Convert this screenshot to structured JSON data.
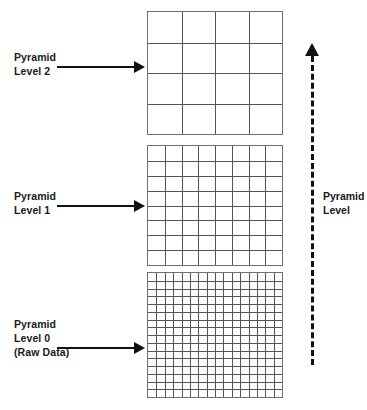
{
  "diagram": {
    "background_color": "#ffffff",
    "line_color": "#555555",
    "text_color": "#1a1a1a"
  },
  "levels": [
    {
      "id": "level-2",
      "label_lines": [
        "Pyramid",
        "Level 2"
      ],
      "grid_columns": 4,
      "grid_rows": 4,
      "arrow": "right-arrow"
    },
    {
      "id": "level-1",
      "label_lines": [
        "Pyramid",
        "Level 1"
      ],
      "grid_columns": 8,
      "grid_rows": 8,
      "arrow": "right-arrow"
    },
    {
      "id": "level-0",
      "label_lines": [
        "Pyramid",
        "Level 0",
        "(Raw Data)"
      ],
      "grid_columns": 16,
      "grid_rows": 16,
      "arrow": "right-arrow"
    }
  ],
  "axis": {
    "label_lines": [
      "Pyramid",
      "Level"
    ],
    "direction": "up",
    "style": "dashed",
    "arrow_icon": "up-arrow-icon"
  }
}
